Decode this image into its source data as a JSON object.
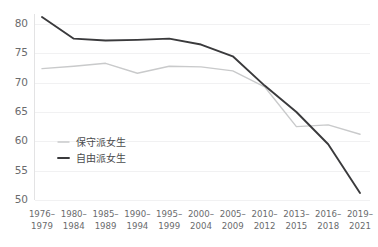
{
  "chart_data": {
    "type": "line",
    "title": "",
    "subtitle": "",
    "xlabel": "",
    "ylabel": "",
    "ylim": [
      50,
      80
    ],
    "yticks": [
      50,
      55,
      60,
      65,
      70,
      75,
      80
    ],
    "ytick_labels": [
      "50",
      "55",
      "60",
      "65",
      "70",
      "75",
      "80"
    ],
    "grid": true,
    "legend_position": "inside lower-left",
    "categories": [
      "1976–\n1979",
      "1980–\n1984",
      "1985–\n1989",
      "1990–\n1994",
      "1995–\n1999",
      "2000–\n2004",
      "2005–\n2009",
      "2010–\n2012",
      "2013–\n2015",
      "2016–\n2018",
      "2019–\n2021"
    ],
    "categories_line1": [
      "1976–",
      "1980–",
      "1985–",
      "1990–",
      "1995–",
      "2000–",
      "2005–",
      "2010–",
      "2013–",
      "2016–",
      "2019–"
    ],
    "categories_line2": [
      "1979",
      "1984",
      "1989",
      "1994",
      "1999",
      "2004",
      "2009",
      "2012",
      "2015",
      "2018",
      "2021"
    ],
    "series": [
      {
        "name": "保守派女生",
        "color": "#c9cacb",
        "values": [
          72.4,
          72.8,
          73.3,
          71.6,
          72.8,
          72.7,
          72.0,
          69.3,
          62.5,
          62.8,
          61.2
        ]
      },
      {
        "name": "自由派女生",
        "color": "#3a3a3c",
        "values": [
          81.2,
          77.5,
          77.2,
          77.3,
          77.5,
          76.5,
          74.5,
          69.5,
          65.0,
          59.5,
          51.2
        ]
      }
    ]
  },
  "legend": {
    "items": [
      {
        "label": "保守派女生",
        "color": "#c9cacb"
      },
      {
        "label": "自由派女生",
        "color": "#3a3a3c"
      }
    ]
  },
  "colors": {
    "background": "#ffffff",
    "gridline": "#f1f1f2",
    "axis": "#e3e3e4",
    "tick_text": "#6a6b6d",
    "legend_text": "#4a4b4d",
    "series_conservative": "#c9cacb",
    "series_liberal": "#3a3a3c"
  }
}
